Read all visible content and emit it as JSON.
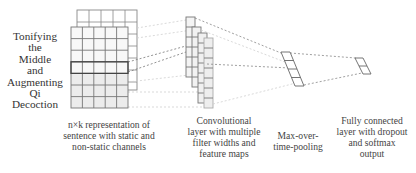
{
  "input": {
    "words": [
      "Tonifying",
      "the",
      "Middle",
      "and",
      "Augmenting",
      "Qi",
      "Decoction"
    ],
    "grid_rows": 7,
    "grid_cols": 5
  },
  "captions": {
    "input": [
      "n×k representation of",
      "sentence with static and",
      "non-static channels"
    ],
    "conv": [
      "Convolutional",
      "layer with multiple",
      "filter widths and",
      "feature maps"
    ],
    "pool": [
      "Max-over-",
      "time-pooling"
    ],
    "fc": [
      "Fully connected",
      "layer with dropout",
      "and softmax",
      "output"
    ]
  },
  "layers": {
    "conv_feature_maps": 4,
    "pooling_cells": 4,
    "output_cells": 2
  },
  "colors": {
    "grid_line": "#777777",
    "grid_line_dark": "#555555",
    "grid_fill_light": "#f6f6f6",
    "grid_fill_shaded": "#ececec",
    "dashed_line": "#999999",
    "dashed_line_light": "#cfcfcf",
    "text": "#333333"
  }
}
